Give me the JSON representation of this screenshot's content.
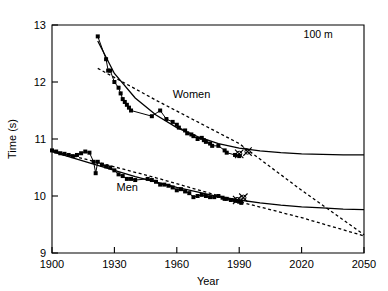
{
  "chart_data": {
    "type": "line",
    "title": "",
    "panel_label": "100 m",
    "xlabel": "Year",
    "ylabel": "Time (s)",
    "xlim": [
      1900,
      2050
    ],
    "ylim": [
      9,
      13
    ],
    "xticks": [
      1900,
      1930,
      1960,
      1990,
      2020,
      2050
    ],
    "yticks": [
      9,
      10,
      11,
      12,
      13
    ],
    "xtick_labels": [
      "1900",
      "1930",
      "1960",
      "1990",
      "2020",
      "2050"
    ],
    "ytick_labels": [
      "9",
      "10",
      "11",
      "12",
      "13"
    ],
    "grid": false,
    "legend_position": "inline-annotations",
    "annotations": [
      {
        "text": "Women",
        "x": 1958,
        "y": 11.72
      },
      {
        "text": "Men",
        "x": 1931,
        "y": 10.08
      },
      {
        "text": "100 m",
        "x": 2035,
        "y": 12.78
      }
    ],
    "series": [
      {
        "name": "Women",
        "kind": "records-markers",
        "marker": "filled-square",
        "color": "#000000",
        "x": [
          1922,
          1926,
          1927,
          1928,
          1930,
          1932,
          1933,
          1934,
          1935,
          1936,
          1937,
          1938,
          1948,
          1952,
          1955,
          1958,
          1960,
          1961,
          1964,
          1965,
          1967,
          1968,
          1970,
          1972,
          1973,
          1974,
          1976,
          1977,
          1980,
          1983,
          1984,
          1988,
          1990
        ],
        "y": [
          12.8,
          12.4,
          12.2,
          12.2,
          12.0,
          11.9,
          11.8,
          11.7,
          11.65,
          11.6,
          11.55,
          11.5,
          11.4,
          11.5,
          11.35,
          11.3,
          11.25,
          11.2,
          11.15,
          11.1,
          11.08,
          11.05,
          11.0,
          11.02,
          10.98,
          10.95,
          10.92,
          10.88,
          10.88,
          10.8,
          10.76,
          10.72,
          10.7
        ]
      },
      {
        "name": "Men",
        "kind": "records-markers",
        "marker": "filled-square",
        "color": "#000000",
        "x": [
          1900,
          1902,
          1904,
          1906,
          1908,
          1910,
          1912,
          1914,
          1916,
          1918,
          1920,
          1921,
          1922,
          1924,
          1926,
          1928,
          1930,
          1932,
          1934,
          1936,
          1938,
          1940,
          1946,
          1948,
          1950,
          1952,
          1954,
          1956,
          1958,
          1960,
          1962,
          1964,
          1966,
          1968,
          1970,
          1972,
          1974,
          1976,
          1978,
          1980,
          1982,
          1983,
          1984,
          1986,
          1988,
          1990,
          1991
        ],
        "y": [
          10.8,
          10.78,
          10.75,
          10.74,
          10.72,
          10.7,
          10.72,
          10.75,
          10.78,
          10.76,
          10.6,
          10.4,
          10.6,
          10.55,
          10.52,
          10.5,
          10.45,
          10.38,
          10.35,
          10.3,
          10.3,
          10.28,
          10.3,
          10.28,
          10.25,
          10.2,
          10.2,
          10.18,
          10.15,
          10.1,
          10.12,
          10.08,
          10.05,
          9.98,
          10.0,
          10.02,
          10.0,
          9.98,
          9.98,
          10.0,
          9.97,
          9.95,
          9.95,
          9.93,
          9.92,
          9.9,
          9.88
        ]
      },
      {
        "name": "Women asymptotic fit",
        "kind": "fit-solid",
        "style": "solid",
        "color": "#000000",
        "x": [
          1922,
          1930,
          1940,
          1950,
          1960,
          1970,
          1980,
          1990,
          2000,
          2010,
          2020,
          2030,
          2040,
          2050
        ],
        "y": [
          12.72,
          12.15,
          11.72,
          11.42,
          11.2,
          11.04,
          10.92,
          10.84,
          10.79,
          10.76,
          10.74,
          10.73,
          10.72,
          10.72
        ]
      },
      {
        "name": "Men asymptotic fit",
        "kind": "fit-solid",
        "style": "solid",
        "color": "#000000",
        "x": [
          1900,
          1920,
          1940,
          1960,
          1980,
          1990,
          2000,
          2010,
          2020,
          2030,
          2040,
          2050
        ],
        "y": [
          10.78,
          10.56,
          10.34,
          10.15,
          9.99,
          9.93,
          9.88,
          9.84,
          9.81,
          9.79,
          9.77,
          9.76
        ]
      },
      {
        "name": "Women linear projection",
        "kind": "fit-dashed",
        "style": "dashed",
        "color": "#000000",
        "x": [
          1922,
          1950,
          1990,
          2020,
          2050
        ],
        "y": [
          12.24,
          11.68,
          10.92,
          10.1,
          9.32
        ]
      },
      {
        "name": "Men linear projection",
        "kind": "fit-dashed",
        "style": "dashed",
        "color": "#000000",
        "x": [
          1900,
          1950,
          1990,
          2020,
          2050
        ],
        "y": [
          10.8,
          10.32,
          9.9,
          9.62,
          9.3
        ]
      },
      {
        "name": "Women record markers (x)",
        "kind": "x-markers",
        "marker": "x",
        "color": "#000000",
        "x": [
          1990,
          1994
        ],
        "y": [
          10.74,
          10.78
        ]
      },
      {
        "name": "Men record markers (x)",
        "kind": "x-markers",
        "marker": "x",
        "color": "#000000",
        "x": [
          1989,
          1992
        ],
        "y": [
          9.93,
          9.97
        ]
      }
    ]
  }
}
